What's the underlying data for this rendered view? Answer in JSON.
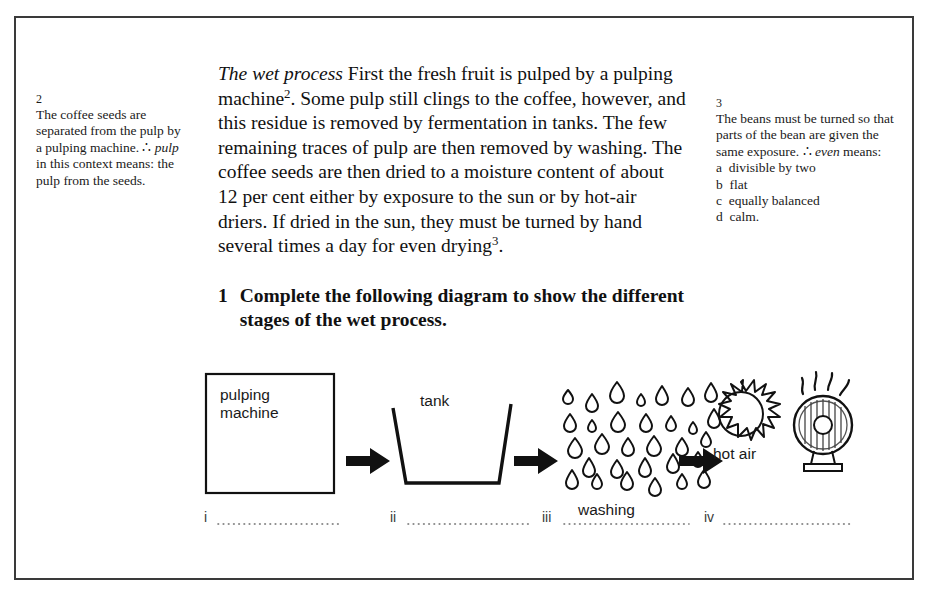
{
  "page": {
    "border_color": "#3a3a3a",
    "background": "#ffffff"
  },
  "notes": {
    "left": {
      "number": "2",
      "text": "The coffee seeds are separated from the pulp by a pulping machine. ∴ ",
      "italic_term": "pulp",
      "text_after": " in this context means: the pulp from the seeds."
    },
    "right": {
      "number": "3",
      "text": "The beans must be turned so that parts of the bean are given the same exposure. ∴ ",
      "italic_term": "even",
      "text_after": " means:",
      "options": [
        "a  divisible by two",
        "b  flat",
        "c  equally balanced",
        "d  calm."
      ]
    }
  },
  "body": {
    "heading_italic": "The wet process",
    "paragraph_part1": " First the fresh fruit is pulped by a pulping machine",
    "footnote_ref_1": "2",
    "paragraph_part2": ". Some pulp still clings to the coffee, however, and this residue is removed by fermentation in tanks. The few remaining traces of pulp are then removed by washing. The coffee seeds are then dried to a moisture content of about 12 per cent either by exposure to the sun or by hot-air driers. If dried in the sun, they must be turned by hand several times a day for even drying",
    "footnote_ref_2": "3",
    "paragraph_part3": "."
  },
  "exercise": {
    "number": "1",
    "text": "Complete the following diagram to show the different stages of the wet process."
  },
  "diagram": {
    "stages": [
      {
        "roman": "i",
        "icon": "pulping-machine-box",
        "label": "pulping\nmachine",
        "label_line1": "pulping",
        "label_line2": "machine",
        "answer_blank": ""
      },
      {
        "roman": "ii",
        "icon": "tank-trapezoid",
        "label": "tank",
        "answer_blank": ""
      },
      {
        "roman": "iii",
        "icon": "water-droplets",
        "label": "washing",
        "answer_blank": ""
      },
      {
        "roman": "iv",
        "icon": "sun-and-hot-air-drier",
        "label": "hot air",
        "answer_blank": ""
      }
    ],
    "arrow_count": 3,
    "droplet_rows": 5
  }
}
